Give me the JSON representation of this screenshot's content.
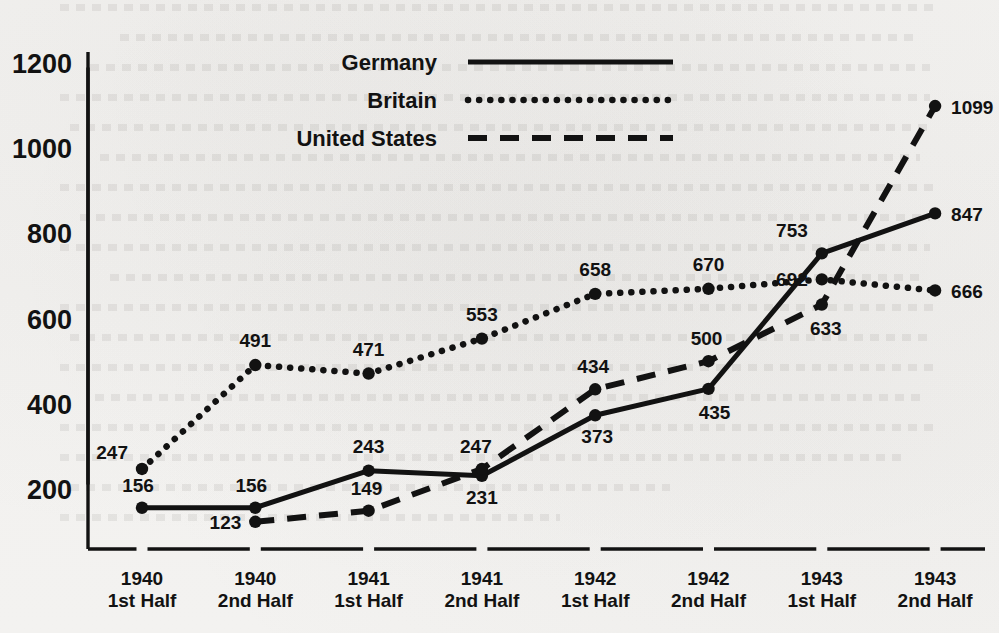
{
  "chart_data": {
    "type": "line",
    "title": "",
    "xlabel": "",
    "ylabel": "",
    "categories": [
      {
        "year": "1940",
        "half": "1st Half"
      },
      {
        "year": "1940",
        "half": "2nd Half"
      },
      {
        "year": "1941",
        "half": "1st Half"
      },
      {
        "year": "1941",
        "half": "2nd Half"
      },
      {
        "year": "1942",
        "half": "1st Half"
      },
      {
        "year": "1942",
        "half": "2nd Half"
      },
      {
        "year": "1943",
        "half": "1st Half"
      },
      {
        "year": "1943",
        "half": "2nd Half"
      }
    ],
    "series": [
      {
        "name": "Germany",
        "style": "solid",
        "values": [
          156,
          156,
          243,
          231,
          373,
          435,
          753,
          847
        ],
        "label_offsets": [
          {
            "dx": -4,
            "dy": -16,
            "anchor": "middle"
          },
          {
            "dx": -4,
            "dy": -16,
            "anchor": "middle"
          },
          {
            "dx": 0,
            "dy": -18,
            "anchor": "middle"
          },
          {
            "dx": 0,
            "dy": 28,
            "anchor": "middle"
          },
          {
            "dx": 2,
            "dy": 28,
            "anchor": "middle"
          },
          {
            "dx": 6,
            "dy": 30,
            "anchor": "middle"
          },
          {
            "dx": -14,
            "dy": -16,
            "anchor": "end"
          },
          {
            "dx": 16,
            "dy": 8,
            "anchor": "start"
          }
        ]
      },
      {
        "name": "Britain",
        "style": "dotted",
        "values": [
          247,
          491,
          471,
          553,
          658,
          670,
          692,
          666
        ],
        "label_offsets": [
          {
            "dx": -14,
            "dy": -10,
            "anchor": "end"
          },
          {
            "dx": 0,
            "dy": -18,
            "anchor": "middle"
          },
          {
            "dx": 0,
            "dy": -18,
            "anchor": "middle"
          },
          {
            "dx": 0,
            "dy": -18,
            "anchor": "middle"
          },
          {
            "dx": 0,
            "dy": -18,
            "anchor": "middle"
          },
          {
            "dx": 0,
            "dy": -18,
            "anchor": "middle"
          },
          {
            "dx": -14,
            "dy": 7,
            "anchor": "end"
          },
          {
            "dx": 16,
            "dy": 8,
            "anchor": "start"
          }
        ]
      },
      {
        "name": "United States",
        "style": "dashed",
        "values": [
          null,
          123,
          149,
          247,
          434,
          500,
          633,
          1099
        ],
        "label_offsets": [
          {
            "dx": 0,
            "dy": 0,
            "anchor": "middle"
          },
          {
            "dx": -14,
            "dy": 7,
            "anchor": "end"
          },
          {
            "dx": -2,
            "dy": -16,
            "anchor": "middle"
          },
          {
            "dx": -6,
            "dy": -16,
            "anchor": "middle"
          },
          {
            "dx": -2,
            "dy": -16,
            "anchor": "middle"
          },
          {
            "dx": -2,
            "dy": -16,
            "anchor": "middle"
          },
          {
            "dx": 4,
            "dy": 30,
            "anchor": "middle"
          },
          {
            "dx": 16,
            "dy": 8,
            "anchor": "start"
          }
        ]
      }
    ],
    "yticks": [
      200,
      400,
      600,
      800,
      1000,
      1200
    ],
    "ylim": [
      0,
      1280
    ],
    "grid": false,
    "legend_position": "top-center",
    "legend": [
      {
        "name": "Germany",
        "style": "solid"
      },
      {
        "name": "Britain",
        "style": "dotted"
      },
      {
        "name": "United States",
        "style": "dashed"
      }
    ],
    "colors": {
      "ink": "#121212",
      "background": "#f3f2f0"
    }
  }
}
